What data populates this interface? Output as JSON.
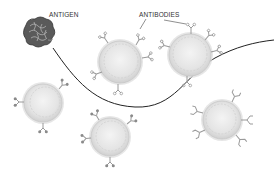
{
  "labels": {
    "antigen": "ANTIGEN",
    "antibodies": "ANTIBODIES"
  },
  "colors": {
    "background": "#ffffff",
    "cell_fill": "#e6e6e6",
    "cell_outer": "#d4d4d4",
    "cell_inner_ring": "#bdbdbd",
    "antibody": "#9a9a9a",
    "antigen": "#4a4a4a",
    "curve": "#222222",
    "text": "#333333"
  },
  "cells": [
    {
      "id": "cell-top-center",
      "cx": 120,
      "cy": 62,
      "r": 22,
      "antibody_style": "y-tipped"
    },
    {
      "id": "cell-top-right",
      "cx": 190,
      "cy": 55,
      "r": 22,
      "antibody_style": "y-tipped"
    },
    {
      "id": "cell-left",
      "cx": 43,
      "cy": 103,
      "r": 20,
      "antibody_style": "dot-tipped"
    },
    {
      "id": "cell-bottom-center",
      "cx": 110,
      "cy": 137,
      "r": 20,
      "antibody_style": "dot-tipped"
    },
    {
      "id": "cell-right",
      "cx": 222,
      "cy": 120,
      "r": 20,
      "antibody_style": "forked"
    }
  ]
}
